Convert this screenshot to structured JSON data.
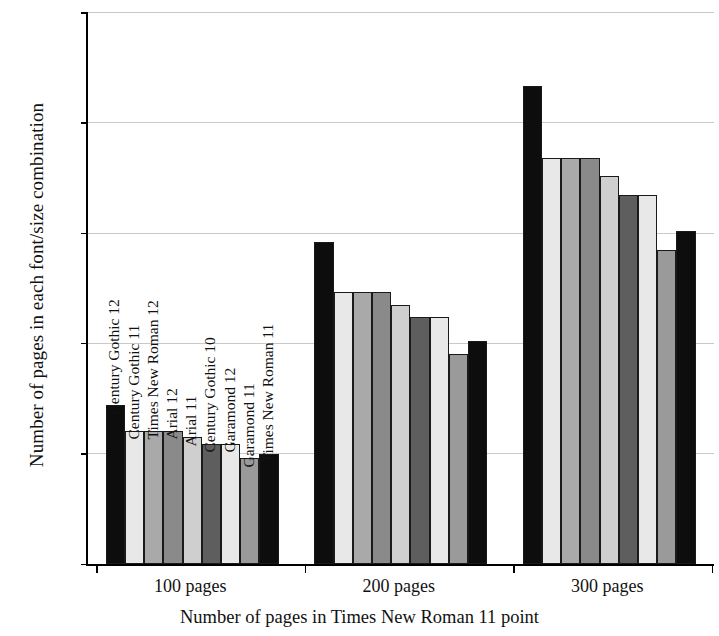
{
  "chart_data": {
    "type": "bar",
    "title": "",
    "xlabel": "Number of pages in Times New Roman 11 point",
    "ylabel": "Number of pages in each font/size combination",
    "categories": [
      "100 pages",
      "200 pages",
      "300 pages"
    ],
    "ylim": [
      0,
      500
    ],
    "yticks": [
      0,
      100,
      200,
      300,
      400,
      500
    ],
    "ytick_labels": [
      "0",
      "100",
      "200",
      "300",
      "400",
      "500"
    ],
    "grid": true,
    "legend": "inline-rotated-labels-on-first-group",
    "series": [
      {
        "name": "Century Gothic 12",
        "color": "#0d0d0d",
        "values": [
          144,
          292,
          433
        ]
      },
      {
        "name": "Century Gothic 11",
        "color": "#e8e8e8",
        "values": [
          121,
          247,
          368
        ]
      },
      {
        "name": "Times New Roman 12",
        "color": "#a9a9a9",
        "values": [
          121,
          247,
          368
        ]
      },
      {
        "name": "Arial 12",
        "color": "#8a8a8a",
        "values": [
          121,
          247,
          368
        ]
      },
      {
        "name": "Arial 11",
        "color": "#cfcfcf",
        "values": [
          115,
          235,
          352
        ]
      },
      {
        "name": "Century Gothic 10",
        "color": "#5e5e5e",
        "values": [
          109,
          224,
          335
        ]
      },
      {
        "name": "Garamond 12",
        "color": "#e8e8e8",
        "values": [
          109,
          224,
          335
        ]
      },
      {
        "name": "Garamond 11",
        "color": "#9a9a9a",
        "values": [
          96,
          190,
          285
        ]
      },
      {
        "name": "Times New Roman 11",
        "color": "#0d0d0d",
        "values": [
          100,
          202,
          302
        ]
      }
    ]
  }
}
